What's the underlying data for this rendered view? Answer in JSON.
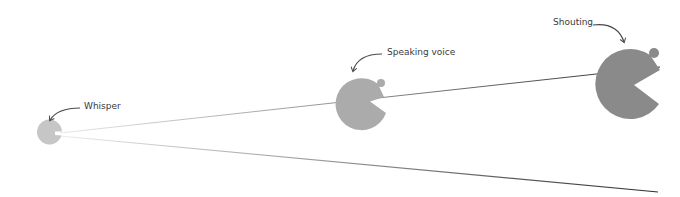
{
  "diagram": {
    "levels": [
      {
        "id": "whisper",
        "label": "Whisper",
        "color": "#c6c6c6"
      },
      {
        "id": "speaking",
        "label": "Speaking voice",
        "color": "#ababab"
      },
      {
        "id": "shouting",
        "label": "Shouting",
        "color": "#8a8a8a"
      }
    ],
    "colors": {
      "arrow": "#4a4a4a",
      "line": "#3a3a3a",
      "background": "#ffffff"
    }
  }
}
